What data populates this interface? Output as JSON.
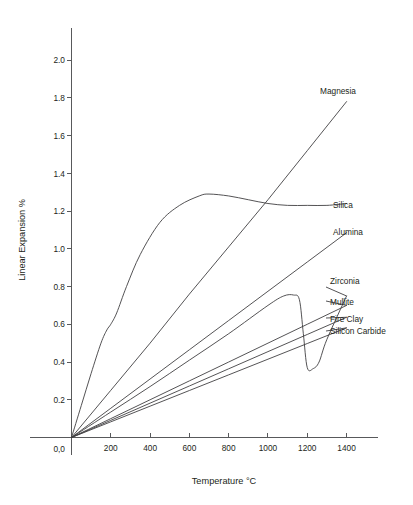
{
  "chart_data": {
    "type": "line",
    "title": "",
    "xlabel": "Temperature °C",
    "ylabel": "Linear Expansion %",
    "xlim": [
      0,
      1560
    ],
    "ylim": [
      0,
      2.17
    ],
    "grid": false,
    "legend_position": "right-inline-labels",
    "origin_label": "0,0",
    "xticks": [
      200,
      400,
      600,
      800,
      1000,
      1200,
      1400
    ],
    "xtick_labels": [
      "200",
      "400",
      "600",
      "800",
      "1000",
      "1200",
      "1400"
    ],
    "yticks": [
      0.2,
      0.4,
      0.6,
      0.8,
      1.0,
      1.2,
      1.4,
      1.6,
      1.8,
      2.0
    ],
    "ytick_labels": [
      "0.2",
      "0.4",
      "0.6",
      "0.8",
      "1.0",
      "1.2",
      "1.4",
      "1.6",
      "1.8",
      "2.0"
    ],
    "series": [
      {
        "name": "Magnesia",
        "label": "Magnesia",
        "shape": "linear",
        "x": [
          0,
          200,
          400,
          600,
          800,
          1000,
          1200,
          1400
        ],
        "y": [
          0.0,
          0.25,
          0.5,
          0.76,
          1.01,
          1.26,
          1.52,
          1.78
        ]
      },
      {
        "name": "Silica",
        "label": "Silica",
        "shape": "sigmoid-plateau",
        "x": [
          0,
          50,
          100,
          150,
          180,
          200,
          230,
          280,
          350,
          450,
          550,
          650,
          700,
          800,
          900,
          1000,
          1100,
          1200,
          1300,
          1400
        ],
        "y": [
          0.0,
          0.17,
          0.34,
          0.5,
          0.57,
          0.6,
          0.66,
          0.8,
          0.97,
          1.14,
          1.23,
          1.28,
          1.29,
          1.28,
          1.26,
          1.24,
          1.23,
          1.23,
          1.23,
          1.24
        ]
      },
      {
        "name": "Alumina",
        "label": "Alumina",
        "shape": "linear",
        "x": [
          0,
          200,
          400,
          600,
          800,
          1000,
          1200,
          1400
        ],
        "y": [
          0.0,
          0.155,
          0.31,
          0.465,
          0.62,
          0.775,
          0.93,
          1.085
        ]
      },
      {
        "name": "Zirconia",
        "label": "Zirconia",
        "shape": "hysteresis",
        "x": [
          0,
          200,
          400,
          600,
          800,
          1000,
          1080,
          1130,
          1160,
          1180,
          1200,
          1230,
          1260,
          1300,
          1400
        ],
        "y": [
          0.0,
          0.135,
          0.27,
          0.41,
          0.55,
          0.7,
          0.75,
          0.755,
          0.73,
          0.55,
          0.37,
          0.365,
          0.4,
          0.52,
          0.75
        ]
      },
      {
        "name": "Mullite",
        "label": "Mullite",
        "shape": "linear",
        "x": [
          0,
          200,
          400,
          600,
          800,
          1000,
          1200,
          1400
        ],
        "y": [
          0.0,
          0.1,
          0.2,
          0.3,
          0.4,
          0.5,
          0.6,
          0.7
        ]
      },
      {
        "name": "Fire Clay",
        "label": "Fire Clay",
        "shape": "linear",
        "x": [
          0,
          200,
          400,
          600,
          800,
          1000,
          1200,
          1400
        ],
        "y": [
          0.0,
          0.091,
          0.182,
          0.273,
          0.364,
          0.455,
          0.546,
          0.637
        ]
      },
      {
        "name": "Silicon Carbide",
        "label": "Silicon Carbide",
        "shape": "linear",
        "x": [
          0,
          200,
          400,
          600,
          800,
          1000,
          1200,
          1400
        ],
        "y": [
          0.0,
          0.083,
          0.166,
          0.249,
          0.332,
          0.415,
          0.498,
          0.581
        ]
      }
    ],
    "annotations": [
      {
        "text": "Magnesia",
        "x": 1420,
        "y": 1.82
      },
      {
        "text": "Silica",
        "x": 1440,
        "y": 1.245
      },
      {
        "text": "Alumina",
        "x": 1440,
        "y": 1.1
      },
      {
        "text": "Zirconia",
        "x": 1440,
        "y": 0.815
      },
      {
        "text": "Mullite",
        "x": 1440,
        "y": 0.715
      },
      {
        "text": "Fire Clay",
        "x": 1440,
        "y": 0.645
      },
      {
        "text": "Silicon Carbide",
        "x": 1440,
        "y": 0.585
      }
    ],
    "colors": {
      "line": "#414042",
      "axis": "#58595b",
      "text": "#231f20",
      "background": "#ffffff"
    }
  }
}
